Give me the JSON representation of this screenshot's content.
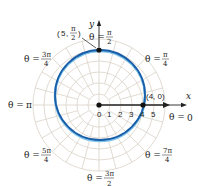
{
  "figure": {
    "type": "polar_graph",
    "curve_color": "#1a5ea8",
    "curve_highlight": "#7fc3ea",
    "grid_color": "#d9d2c8",
    "axis_color": "#222222",
    "center_px": [
      99,
      105
    ],
    "unit_px": 11,
    "grid_rings": [
      1,
      2,
      3,
      4,
      5,
      6
    ],
    "curve": {
      "cx": 100,
      "cy": 95,
      "r": 45
    }
  },
  "axes": {
    "x_label": "x",
    "y_label": "y"
  },
  "radial_ticks": [
    "0",
    "1",
    "2",
    "3",
    "4",
    "5"
  ],
  "points": [
    {
      "label_r": "5",
      "label_theta_num": "π",
      "label_theta_den": "2",
      "text": "(5, π/2)"
    },
    {
      "label": "(4, 0)"
    }
  ],
  "angle_labels": {
    "theta": "θ =",
    "zero": "0",
    "pi": "π",
    "pi_over_2": {
      "num": "π",
      "den": "2"
    },
    "pi_over_4": {
      "num": "π",
      "den": "4"
    },
    "three_pi_over_4": {
      "num": "3π",
      "den": "4"
    },
    "five_pi_over_4": {
      "num": "5π",
      "den": "4"
    },
    "three_pi_over_2": {
      "num": "3π",
      "den": "2"
    },
    "seven_pi_over_4": {
      "num": "7π",
      "den": "4"
    }
  }
}
